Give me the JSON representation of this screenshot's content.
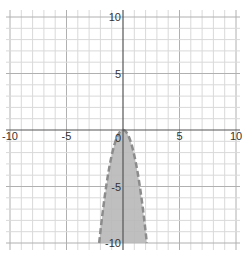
{
  "chart_data": {
    "type": "area",
    "title": "",
    "xlabel": "",
    "ylabel": "",
    "xlim": [
      -10,
      10
    ],
    "ylim": [
      -10,
      10
    ],
    "grid": true,
    "grid_step": 1,
    "major_step": 5,
    "x_ticks": [
      {
        "value": -10,
        "label": "-10"
      },
      {
        "value": -5,
        "label": "-5"
      },
      {
        "value": 5,
        "label": "5"
      },
      {
        "value": 10,
        "label": "10"
      }
    ],
    "y_ticks": [
      {
        "value": 10,
        "label": "10"
      },
      {
        "value": 5,
        "label": "5"
      },
      {
        "value": -5,
        "label": "-5"
      },
      {
        "value": -10,
        "label": "-10"
      }
    ],
    "origin_label": "0",
    "series": [
      {
        "name": "inequality y < -2.25x^2",
        "kind": "parabola",
        "a": -2.25,
        "vertex": [
          0,
          0
        ],
        "boundary": "dashed",
        "shaded": "below",
        "x": [
          -2.11,
          -2,
          -1.5,
          -1,
          -0.5,
          0,
          0.5,
          1,
          1.5,
          2,
          2.11
        ],
        "y": [
          -10,
          -9,
          -5.06,
          -2.25,
          -0.56,
          0,
          -0.56,
          -2.25,
          -5.06,
          -9,
          -10
        ]
      }
    ],
    "colors": {
      "grid_minor": "#d9d9d9",
      "axis": "#555555",
      "fill": "#b8b8b8",
      "boundary": "#8c8c8c"
    }
  }
}
